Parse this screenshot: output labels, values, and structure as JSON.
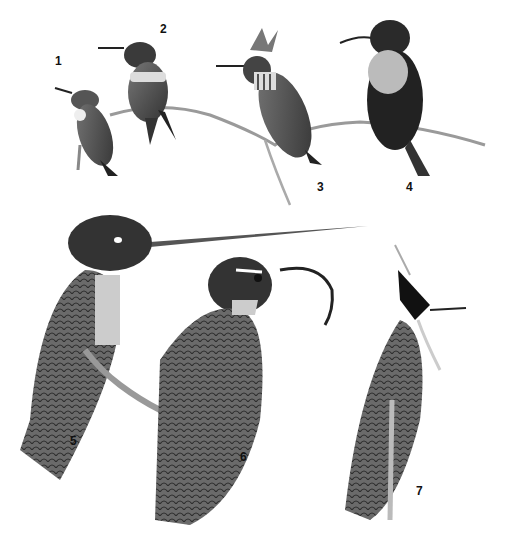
{
  "plate": {
    "description": "Black-and-white engraving-style illustration plate of seven hummingbirds",
    "background": "#ffffff",
    "ink": "#1a1a1a",
    "figures": [
      {
        "number": "1",
        "x": 55,
        "y": 60,
        "subject": "small hummingbird perched, white throat"
      },
      {
        "number": "2",
        "x": 160,
        "y": 28,
        "subject": "hummingbird with pale breast band, perched on branch"
      },
      {
        "number": "3",
        "x": 263,
        "y": 185,
        "subject": "crested hummingbird with spotted throat"
      },
      {
        "number": "4",
        "x": 405,
        "y": 185,
        "subject": "dark hummingbird with pale bib, curved bill"
      },
      {
        "number": "5",
        "x": 68,
        "y": 438,
        "subject": "sword-billed hummingbird with extremely long bill"
      },
      {
        "number": "6",
        "x": 240,
        "y": 460,
        "subject": "sicklebill hummingbird with strongly curved bill"
      },
      {
        "number": "7",
        "x": 415,
        "y": 490,
        "subject": "crested hummingbird with dark face and white plumes"
      }
    ]
  }
}
